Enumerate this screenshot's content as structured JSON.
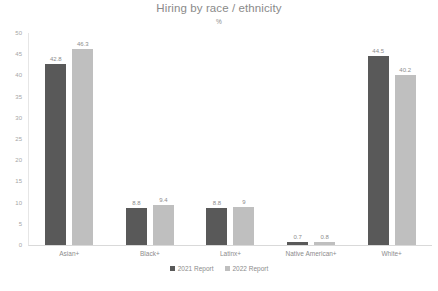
{
  "chart_data": {
    "type": "bar",
    "title": "Hiring by race / ethnicity",
    "subtitle": "%",
    "xlabel": "",
    "ylabel": "",
    "ylim": [
      0,
      50
    ],
    "ytick_step": 5,
    "yticks": [
      "50",
      "45",
      "40",
      "35",
      "30",
      "25",
      "20",
      "15",
      "10",
      "5",
      "0"
    ],
    "grid": false,
    "legend_position": "bottom",
    "categories": [
      "Asian+",
      "Black+",
      "Latinx+",
      "Native American+",
      "White+"
    ],
    "series": [
      {
        "name": "2021 Report",
        "color": "#595959",
        "values": [
          42.8,
          8.8,
          8.8,
          0.7,
          44.5
        ],
        "labels": [
          "42.8",
          "8.8",
          "8.8",
          "0.7",
          "44.5"
        ]
      },
      {
        "name": "2022 Report",
        "color": "#bfbfbf",
        "values": [
          46.3,
          9.4,
          9,
          0.8,
          40.2
        ],
        "labels": [
          "46.3",
          "9.4",
          "9",
          "0.8",
          "40.2"
        ]
      }
    ]
  }
}
